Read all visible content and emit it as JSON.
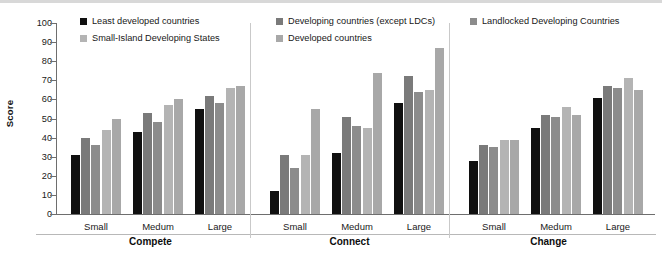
{
  "chart_data": {
    "type": "bar",
    "title": "",
    "xlabel": "",
    "ylabel": "Score",
    "ylim": [
      0,
      100
    ],
    "ytick_step": 10,
    "yticks": [
      0,
      10,
      20,
      30,
      40,
      50,
      60,
      70,
      80,
      90,
      100
    ],
    "grid": false,
    "legend_position": "top",
    "group_labels": [
      "Compete",
      "Connect",
      "Change"
    ],
    "categories": [
      "Compete / Small",
      "Compete / Medum",
      "Compete / Large",
      "Connect / Small",
      "Connect / Medum",
      "Connect / Large",
      "Change / Small",
      "Change / Medum",
      "Change / Large"
    ],
    "size_labels": [
      "Small",
      "Medum",
      "Large"
    ],
    "series": [
      {
        "name": "Least developed countries",
        "color": "#101010",
        "values": [
          31,
          43,
          55,
          12,
          32,
          58,
          28,
          45,
          61
        ]
      },
      {
        "name": "Developing countries (except LDCs)",
        "color": "#7a7a7a",
        "values": [
          40,
          53,
          62,
          31,
          51,
          72,
          36,
          52,
          67
        ]
      },
      {
        "name": "Landlocked Developing Countries",
        "color": "#8c8c8c",
        "values": [
          36,
          48,
          58,
          24,
          46,
          64,
          35,
          51,
          66
        ]
      },
      {
        "name": "Small-Island Developing States",
        "color": "#b4b4b4",
        "values": [
          44,
          57,
          66,
          31,
          45,
          65,
          39,
          56,
          71
        ]
      },
      {
        "name": "Developed countries",
        "color": "#a8a8a8",
        "values": [
          50,
          60,
          67,
          55,
          74,
          87,
          39,
          52,
          65
        ]
      }
    ]
  }
}
